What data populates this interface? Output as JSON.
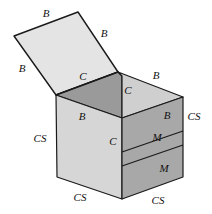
{
  "figure": {
    "width": 212,
    "height": 214,
    "background": "#ffffff"
  },
  "colors": {
    "background": "#ffffff",
    "stroke": "#1a1a1a",
    "lid_top": "#e4e4e4",
    "flap_left_dark": "#9a9a9a",
    "flap_right_light": "#cfcfcf",
    "face_left_light": "#d6d6d6",
    "face_right_dark": "#a8a8a8",
    "label_color": "#111111"
  },
  "geometry": {
    "lid": {
      "name": "open-lid-panel",
      "points": "14,36 78,12 118,72 56,95",
      "fill": "#e4e4e4"
    },
    "flap_left": {
      "name": "top-flap-left",
      "points": "56,95 122,74 122,118 56,95",
      "fill": "#9a9a9a"
    },
    "flap_left_full": {
      "name": "top-flap-left-full",
      "points": "56,95 118,72 122,76 122,118",
      "fill": "#9a9a9a"
    },
    "flap_right": {
      "name": "top-flap-right",
      "points": "122,76 183,97 122,118",
      "fill": "#cfcfcf"
    },
    "flap_right_quad": {
      "name": "top-flap-right-quad",
      "points": "118,72 183,97 122,118 122,76",
      "fill": "#cfcfcf"
    },
    "face_left": {
      "name": "front-left-face",
      "points": "56,95 122,118 122,199 57,177",
      "fill": "#d6d6d6"
    },
    "face_right": {
      "name": "front-right-face",
      "points": "122,118 183,97 183,177 122,199",
      "fill": "#a8a8a8"
    },
    "band_top": {
      "name": "right-face-band-divider-upper",
      "points": "122,152 183,131"
    },
    "band_bottom": {
      "name": "right-face-band-divider-lower",
      "points": "122,166 183,145"
    },
    "hinge_edge": {
      "name": "lid-hinge-edge",
      "points": "56,95 118,72"
    }
  },
  "labels": [
    {
      "id": "b-lid-top",
      "text": "B",
      "x": 46,
      "y": 13,
      "name": "label-b-lid-top-edge"
    },
    {
      "id": "b-lid-right",
      "text": "B",
      "x": 104,
      "y": 33,
      "name": "label-b-lid-right-edge"
    },
    {
      "id": "b-lid-left",
      "text": "B",
      "x": 22,
      "y": 68,
      "name": "label-b-lid-left-edge"
    },
    {
      "id": "c-top-left",
      "text": "C",
      "x": 83,
      "y": 76,
      "name": "label-c-top-left-flap"
    },
    {
      "id": "c-hinge",
      "text": "C",
      "x": 128,
      "y": 90,
      "name": "label-c-hinge-edge"
    },
    {
      "id": "b-top-right",
      "text": "B",
      "x": 156,
      "y": 75,
      "name": "label-b-top-right-edge"
    },
    {
      "id": "b-flap-front",
      "text": "B",
      "x": 82,
      "y": 116,
      "name": "label-b-flap-front-edge"
    },
    {
      "id": "b-right-upper",
      "text": "B",
      "x": 167,
      "y": 115,
      "name": "label-b-right-face-upper"
    },
    {
      "id": "cs-right-edge",
      "text": "CS",
      "x": 194,
      "y": 116,
      "name": "label-cs-right-vertical-edge"
    },
    {
      "id": "cs-left-edge",
      "text": "CS",
      "x": 40,
      "y": 138,
      "name": "label-cs-left-vertical-edge"
    },
    {
      "id": "c-front-edge",
      "text": "C",
      "x": 113,
      "y": 141,
      "name": "label-c-front-vertical-edge"
    },
    {
      "id": "m-band-upper",
      "text": "M",
      "x": 157,
      "y": 137,
      "name": "label-m-band-upper"
    },
    {
      "id": "m-band-lower",
      "text": "M",
      "x": 164,
      "y": 168,
      "name": "label-m-band-lower"
    },
    {
      "id": "cs-bottom-left",
      "text": "CS",
      "x": 80,
      "y": 197,
      "name": "label-cs-bottom-left-edge"
    },
    {
      "id": "cs-bottom-right",
      "text": "CS",
      "x": 158,
      "y": 200,
      "name": "label-cs-bottom-right-edge"
    }
  ],
  "legend": {
    "B": "B",
    "C": "C",
    "M": "M",
    "CS": "CS"
  }
}
